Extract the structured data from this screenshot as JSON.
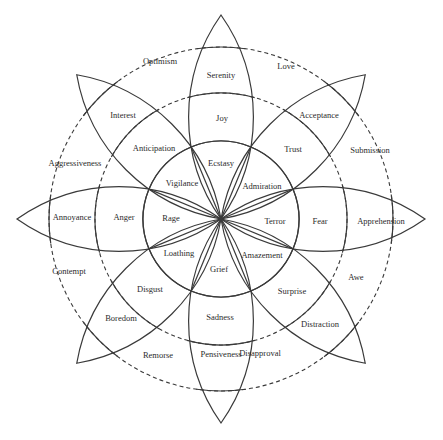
{
  "geometry": {
    "center": [
      221,
      219
    ],
    "inner_radius": 78,
    "middle_radius": 126,
    "outer_radius": 172,
    "tip_radius": 204
  },
  "primary_emotions": [
    {
      "angle": -90,
      "intense": "Ecstasy",
      "basic": "Joy",
      "mild": "Serenity"
    },
    {
      "angle": -45,
      "intense": "Admiration",
      "basic": "Trust",
      "mild": "Acceptance"
    },
    {
      "angle": 0,
      "intense": "Terror",
      "basic": "Fear",
      "mild": "Apprehension"
    },
    {
      "angle": 45,
      "intense": "Amazement",
      "basic": "Surprise",
      "mild": "Distraction"
    },
    {
      "angle": 90,
      "intense": "Grief",
      "basic": "Sadness",
      "mild": "Pensiveness"
    },
    {
      "angle": 135,
      "intense": "Loathing",
      "basic": "Disgust",
      "mild": "Boredom"
    },
    {
      "angle": 180,
      "intense": "Rage",
      "basic": "Anger",
      "mild": "Annoyance"
    },
    {
      "angle": -135,
      "intense": "Vigilance",
      "basic": "Anticipation",
      "mild": "Interest"
    }
  ],
  "dyads": [
    {
      "angle": -67.5,
      "label": "Love"
    },
    {
      "angle": -22.5,
      "label": "Submission"
    },
    {
      "angle": 22.5,
      "label": "Awe"
    },
    {
      "angle": 67.5,
      "label": "Disapproval"
    },
    {
      "angle": 112.5,
      "label": "Remorse"
    },
    {
      "angle": 157.5,
      "label": "Contempt"
    },
    {
      "angle": -157.5,
      "label": "Aggressiveness"
    },
    {
      "angle": -112.5,
      "label": "Optimism"
    }
  ],
  "labels": [
    {
      "text": "Serenity",
      "x": 221,
      "y": 76
    },
    {
      "text": "Joy",
      "x": 222,
      "y": 119
    },
    {
      "text": "Ecstasy",
      "x": 221,
      "y": 164
    },
    {
      "text": "Acceptance",
      "x": 319,
      "y": 116
    },
    {
      "text": "Trust",
      "x": 293,
      "y": 150
    },
    {
      "text": "Admiration",
      "x": 262,
      "y": 187
    },
    {
      "text": "Apprehension",
      "x": 381,
      "y": 222
    },
    {
      "text": "Fear",
      "x": 320,
      "y": 222
    },
    {
      "text": "Terror",
      "x": 275,
      "y": 222
    },
    {
      "text": "Distraction",
      "x": 320,
      "y": 325
    },
    {
      "text": "Surprise",
      "x": 292,
      "y": 292
    },
    {
      "text": "Amazement",
      "x": 262,
      "y": 256
    },
    {
      "text": "Pensiveness",
      "x": 221,
      "y": 355
    },
    {
      "text": "Sadness",
      "x": 220,
      "y": 318
    },
    {
      "text": "Grief",
      "x": 219,
      "y": 270
    },
    {
      "text": "Boredom",
      "x": 121,
      "y": 319
    },
    {
      "text": "Disgust",
      "x": 150,
      "y": 290
    },
    {
      "text": "Loathing",
      "x": 179,
      "y": 254
    },
    {
      "text": "Annoyance",
      "x": 72,
      "y": 218
    },
    {
      "text": "Anger",
      "x": 124,
      "y": 218
    },
    {
      "text": "Rage",
      "x": 171,
      "y": 219
    },
    {
      "text": "Interest",
      "x": 123,
      "y": 116
    },
    {
      "text": "Anticipation",
      "x": 154,
      "y": 149
    },
    {
      "text": "Vigilance",
      "x": 182,
      "y": 184
    },
    {
      "text": "Optimism",
      "x": 160,
      "y": 62
    },
    {
      "text": "Love",
      "x": 286,
      "y": 67
    },
    {
      "text": "Submission",
      "x": 370,
      "y": 151
    },
    {
      "text": "Aggressiveness",
      "x": 75,
      "y": 164
    },
    {
      "text": "Contempt",
      "x": 69,
      "y": 272
    },
    {
      "text": "Awe",
      "x": 356,
      "y": 278
    },
    {
      "text": "Remorse",
      "x": 158,
      "y": 356
    },
    {
      "text": "Disapproval",
      "x": 260,
      "y": 354
    }
  ]
}
